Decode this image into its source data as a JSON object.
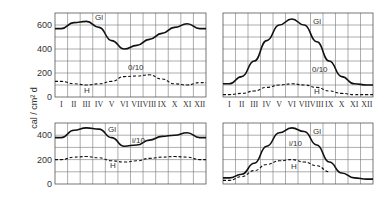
{
  "chart_data": [
    {
      "type": "line",
      "panel": "top-left",
      "frame": {
        "x": 55,
        "y": 13,
        "w": 151,
        "h": 84
      },
      "ylim": [
        0,
        700
      ],
      "yticks": [
        0,
        200,
        400,
        600
      ],
      "grid": true,
      "categories": [
        "I",
        "II",
        "III",
        "IV",
        "V",
        "VI",
        "VII",
        "VIII",
        "IX",
        "X",
        "XI",
        "XII"
      ],
      "series": [
        {
          "name": "Gl",
          "style": "solid",
          "values": [
            570,
            620,
            630,
            580,
            470,
            400,
            430,
            480,
            530,
            580,
            610,
            570
          ]
        },
        {
          "name": "H",
          "style": "dashed",
          "values": [
            130,
            110,
            100,
            110,
            130,
            170,
            175,
            185,
            150,
            110,
            100,
            120
          ]
        }
      ],
      "annotations": [
        {
          "text": "Gl",
          "x": 95,
          "y": 20
        },
        {
          "text": "0/10",
          "x": 128,
          "y": 70
        },
        {
          "text": "H",
          "x": 84,
          "y": 93
        }
      ],
      "show_xticks": true
    },
    {
      "type": "line",
      "panel": "top-right",
      "frame": {
        "x": 223,
        "y": 13,
        "w": 150,
        "h": 84
      },
      "ylim": [
        0,
        700
      ],
      "grid": true,
      "categories": [
        "I",
        "II",
        "III",
        "IV",
        "V",
        "VI",
        "VII",
        "VIII",
        "IX",
        "X",
        "XI",
        "XII"
      ],
      "series": [
        {
          "name": "Gl",
          "style": "solid",
          "values": [
            110,
            170,
            300,
            470,
            600,
            650,
            600,
            460,
            300,
            170,
            110,
            100
          ]
        },
        {
          "name": "H",
          "style": "dashed",
          "values": [
            20,
            30,
            50,
            80,
            100,
            110,
            100,
            80,
            50,
            30,
            20,
            20
          ]
        }
      ],
      "annotations": [
        {
          "text": "Gl",
          "x": 313,
          "y": 24
        },
        {
          "text": "0/10",
          "x": 312,
          "y": 72
        },
        {
          "text": "H",
          "x": 314,
          "y": 94
        }
      ],
      "show_xticks": true
    },
    {
      "type": "line",
      "panel": "bottom-left",
      "frame": {
        "x": 55,
        "y": 123,
        "w": 151,
        "h": 61
      },
      "ylim": [
        0,
        500
      ],
      "yticks": [
        0,
        200,
        400
      ],
      "grid": true,
      "categories": [
        "I",
        "II",
        "III",
        "IV",
        "V",
        "VI",
        "VII",
        "VIII",
        "IX",
        "X",
        "XI",
        "XII"
      ],
      "series": [
        {
          "name": "Gl",
          "style": "solid",
          "values": [
            380,
            440,
            460,
            450,
            380,
            310,
            320,
            360,
            390,
            400,
            420,
            380
          ]
        },
        {
          "name": "H",
          "style": "dashed",
          "values": [
            200,
            220,
            225,
            215,
            190,
            180,
            190,
            210,
            220,
            225,
            220,
            200
          ]
        }
      ],
      "annotations": [
        {
          "text": "Gl",
          "x": 108,
          "y": 132
        },
        {
          "text": "i/10",
          "x": 132,
          "y": 143
        },
        {
          "text": "H",
          "x": 110,
          "y": 168
        }
      ],
      "show_xticks": false
    },
    {
      "type": "line",
      "panel": "bottom-right",
      "frame": {
        "x": 223,
        "y": 123,
        "w": 150,
        "h": 61
      },
      "ylim": [
        0,
        500
      ],
      "grid": true,
      "categories": [
        "I",
        "II",
        "III",
        "IV",
        "V",
        "VI",
        "VII",
        "VIII",
        "IX",
        "X",
        "XI",
        "XII"
      ],
      "series": [
        {
          "name": "Gl",
          "style": "solid",
          "values": [
            50,
            80,
            170,
            310,
            420,
            460,
            430,
            320,
            180,
            90,
            50,
            40
          ]
        },
        {
          "name": "H",
          "style": "dashed",
          "values": [
            30,
            60,
            110,
            160,
            190,
            200,
            180,
            150,
            100,
            null,
            null,
            null
          ]
        }
      ],
      "annotations": [
        {
          "text": "Gl",
          "x": 313,
          "y": 134
        },
        {
          "text": "i/10",
          "x": 289,
          "y": 146
        },
        {
          "text": "H",
          "x": 291,
          "y": 169
        }
      ],
      "show_xticks": false
    }
  ],
  "ylabel": "cal / cm² d"
}
